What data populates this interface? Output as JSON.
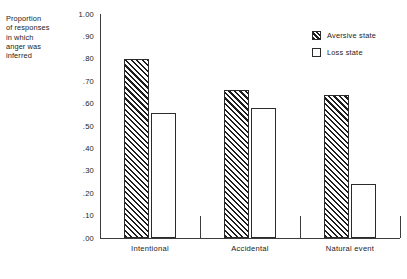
{
  "chart_data": {
    "type": "bar",
    "title": "",
    "xlabel": "",
    "ylabel": "Proportion of responses in which anger was inferred",
    "ylabel_lines": [
      "Proportion",
      "of responses",
      "in  which",
      "anger was",
      "inferred"
    ],
    "categories": [
      "Intentional",
      "Accidental",
      "Natural event"
    ],
    "series": [
      {
        "name": "Aversive state",
        "pattern": "hatched",
        "values": [
          0.8,
          0.66,
          0.64
        ]
      },
      {
        "name": "Loss state",
        "pattern": "open",
        "values": [
          0.56,
          0.58,
          0.24
        ]
      }
    ],
    "ylim": [
      0.0,
      1.0
    ],
    "ytick_labels": [
      "1.00",
      ".90",
      ".80",
      ".70",
      ".60",
      ".50",
      ".40",
      ".30",
      ".20",
      ".10",
      ".00"
    ],
    "ytick_values": [
      1.0,
      0.9,
      0.8,
      0.7,
      0.6,
      0.5,
      0.4,
      0.3,
      0.2,
      0.1,
      0.0
    ],
    "grid": false,
    "legend_position": "upper-right-inside",
    "legend": [
      {
        "label": "Aversive state",
        "swatch": "hatched-square-icon"
      },
      {
        "label": "Loss state",
        "swatch": "open-square-icon"
      }
    ],
    "colors": {
      "axis": "#3c3c3c",
      "bar_outline": "#2b2b2b",
      "hatch": "#1e1e1e",
      "fill": "#ffffff",
      "text": "#222222",
      "background": "#ffffff"
    }
  }
}
